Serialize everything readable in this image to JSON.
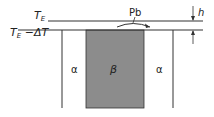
{
  "diagram": {
    "labels": {
      "top_temperature": "T",
      "top_temperature_sub": "E",
      "lower_temperature": "T",
      "lower_temperature_sub": "E",
      "lower_temperature_suffix": " −ΔT",
      "element": "Pb",
      "height": "h",
      "left_phase": "α",
      "center_phase": "β",
      "right_phase": "α"
    },
    "colors": {
      "line": "#333333",
      "beta_fill": "#8c8c8c",
      "background": "#ffffff"
    }
  }
}
